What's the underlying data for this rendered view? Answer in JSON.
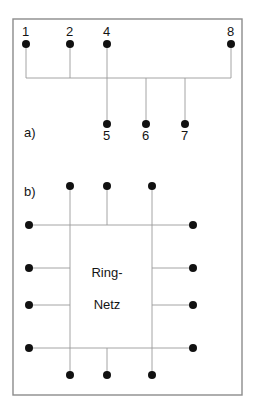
{
  "figure": {
    "title_text": "",
    "background_color": "#ffffff",
    "border_color": "#8c8c8c",
    "line_color": "#9a9a9a",
    "node_color": "#111111",
    "text_color": "#141414",
    "border": {
      "x": 13,
      "y": 19,
      "width": 229,
      "height": 376
    }
  },
  "part_a": {
    "label": "a)",
    "label_pos": {
      "x": 24,
      "y": 137
    },
    "bus": {
      "x1": 26,
      "y1": 78,
      "x2": 231,
      "y2": 78
    },
    "top_nodes": [
      {
        "id": "1",
        "label": "1",
        "cx": 26,
        "cy": 44,
        "label_x": 22,
        "label_y": 36
      },
      {
        "id": "2",
        "label": "2",
        "cx": 70,
        "cy": 44,
        "label_x": 66,
        "label_y": 36
      },
      {
        "id": "4",
        "label": "4",
        "cx": 107,
        "cy": 44,
        "label_x": 103,
        "label_y": 36
      },
      {
        "id": "8",
        "label": "8",
        "cx": 231,
        "cy": 44,
        "label_x": 227,
        "label_y": 36
      }
    ],
    "bottom_nodes": [
      {
        "id": "5",
        "label": "5",
        "cx": 107,
        "cy": 124,
        "label_x": 103,
        "label_y": 140
      },
      {
        "id": "6",
        "label": "6",
        "cx": 146,
        "cy": 124,
        "label_x": 142,
        "label_y": 140
      },
      {
        "id": "7",
        "label": "7",
        "cx": 185,
        "cy": 124,
        "label_x": 181,
        "label_y": 140
      }
    ],
    "stubs": [
      {
        "x1": 26,
        "y1": 44,
        "x2": 26,
        "y2": 78
      },
      {
        "x1": 70,
        "y1": 44,
        "x2": 70,
        "y2": 78
      },
      {
        "x1": 107,
        "y1": 44,
        "x2": 107,
        "y2": 124
      },
      {
        "x1": 231,
        "y1": 44,
        "x2": 231,
        "y2": 78
      },
      {
        "x1": 146,
        "y1": 78,
        "x2": 146,
        "y2": 124
      },
      {
        "x1": 185,
        "y1": 78,
        "x2": 185,
        "y2": 124
      }
    ]
  },
  "part_b": {
    "label": "b)",
    "label_pos": {
      "x": 24,
      "y": 196
    },
    "center_text_line1": "Ring-",
    "center_text_line2": "Netz",
    "center_text_pos": {
      "x": 107,
      "y": 277,
      "y2": 309
    },
    "top_nodes": [
      {
        "cx": 70,
        "cy": 186
      },
      {
        "cx": 107,
        "cy": 186
      },
      {
        "cx": 152,
        "cy": 186
      }
    ],
    "bottom_nodes": [
      {
        "cx": 70,
        "cy": 375
      },
      {
        "cx": 107,
        "cy": 375
      },
      {
        "cx": 152,
        "cy": 375
      }
    ],
    "left_nodes": [
      {
        "cx": 29,
        "cy": 225
      },
      {
        "cx": 29,
        "cy": 268
      },
      {
        "cx": 29,
        "cy": 305
      },
      {
        "cx": 29,
        "cy": 348
      }
    ],
    "right_nodes": [
      {
        "cx": 193,
        "cy": 225
      },
      {
        "cx": 193,
        "cy": 268
      },
      {
        "cx": 193,
        "cy": 305
      },
      {
        "cx": 193,
        "cy": 348
      }
    ],
    "h_lines": [
      {
        "x1": 29,
        "y1": 225,
        "x2": 193,
        "y2": 225
      },
      {
        "x1": 29,
        "y1": 268,
        "x2": 70,
        "y2": 268
      },
      {
        "x1": 152,
        "y1": 268,
        "x2": 193,
        "y2": 268
      },
      {
        "x1": 29,
        "y1": 305,
        "x2": 70,
        "y2": 305
      },
      {
        "x1": 152,
        "y1": 305,
        "x2": 193,
        "y2": 305
      },
      {
        "x1": 29,
        "y1": 348,
        "x2": 193,
        "y2": 348
      }
    ],
    "v_lines": [
      {
        "x1": 70,
        "y1": 186,
        "x2": 70,
        "y2": 348
      },
      {
        "x1": 107,
        "y1": 186,
        "x2": 107,
        "y2": 225
      },
      {
        "x1": 152,
        "y1": 186,
        "x2": 152,
        "y2": 375
      },
      {
        "x1": 70,
        "y1": 348,
        "x2": 70,
        "y2": 375
      },
      {
        "x1": 107,
        "y1": 348,
        "x2": 107,
        "y2": 375
      }
    ]
  },
  "geometry": {
    "node_radius": 4,
    "line_width": 0.9,
    "border_width": 1.4
  }
}
